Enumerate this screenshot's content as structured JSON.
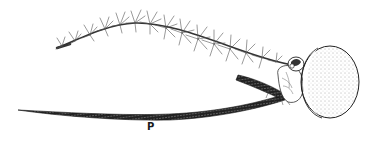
{
  "figure": {
    "labels": [
      {
        "id": "proboscis",
        "text": "P",
        "x": 147,
        "y": 121
      }
    ],
    "colors": {
      "ink": "#1a1a1a",
      "stipple": "#555555",
      "background": "#ffffff"
    }
  }
}
